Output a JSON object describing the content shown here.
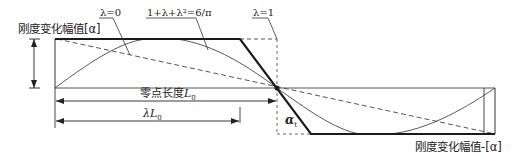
{
  "diagram": {
    "title": "",
    "labels": {
      "top_axis": "刚度变化幅值[α]",
      "bottom_axis": "刚度变化幅值-[α]",
      "lambda0": "λ=0",
      "equation": "1+λ+λ²=6/π",
      "lambda1": "λ=1",
      "zero_length": "零点长度",
      "zero_length_symbol": "L",
      "zero_length_sub": "0",
      "lambda_L": "λL",
      "lambda_L_sub": "0",
      "alpha": "α",
      "alpha_sub": "t"
    },
    "curves": [
      {
        "name": "lambda=0",
        "style": "dashed",
        "description": "straight dashed line from top-left to bottom-right"
      },
      {
        "name": "1+λ+λ²=6/π",
        "style": "thin solid",
        "description": "sinusoidal curve"
      },
      {
        "name": "λ=1",
        "style": "dashed",
        "description": "step function bounding box"
      },
      {
        "name": "λL0",
        "style": "thick solid",
        "description": "trapezoidal profile"
      }
    ],
    "colors": {
      "line": "#1a1a1a",
      "thin_line": "#444444",
      "dashed": "#555555",
      "background": "#ffffff"
    }
  }
}
